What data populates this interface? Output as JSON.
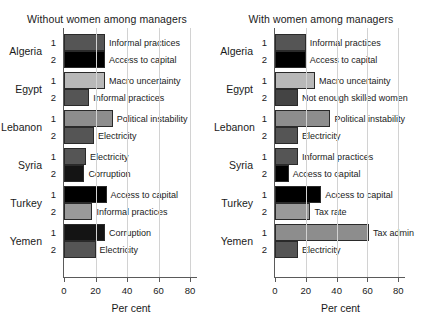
{
  "chart_data": {
    "type": "bar",
    "orientation": "horizontal",
    "title": "",
    "xlabel": "Per cent",
    "ylabel": "",
    "xlim": [
      0,
      85
    ],
    "xticks": [
      0,
      20,
      40,
      60,
      80
    ],
    "grid": true,
    "legend": "none",
    "panels": [
      {
        "title": "Without women among managers",
        "xlabel": "Per cent",
        "groups": [
          {
            "country": "Algeria",
            "items": [
              {
                "rank": "1",
                "label": "Informal practices",
                "value": 26,
                "color": "#555555"
              },
              {
                "rank": "2",
                "label": "Access to capital",
                "value": 26,
                "color": "#000000"
              }
            ]
          },
          {
            "country": "Egypt",
            "items": [
              {
                "rank": "1",
                "label": "Macro uncertainty",
                "value": 26,
                "color": "#b8b8b8"
              },
              {
                "rank": "2",
                "label": "Informal practices",
                "value": 16,
                "color": "#555555"
              }
            ]
          },
          {
            "country": "Lebanon",
            "items": [
              {
                "rank": "1",
                "label": "Political instability",
                "value": 31,
                "color": "#8d8d8d"
              },
              {
                "rank": "2",
                "label": "Electricity",
                "value": 19,
                "color": "#555555"
              }
            ]
          },
          {
            "country": "Syria",
            "items": [
              {
                "rank": "1",
                "label": "Electricity",
                "value": 14,
                "color": "#555555"
              },
              {
                "rank": "2",
                "label": "Corruption",
                "value": 13,
                "color": "#141414"
              }
            ]
          },
          {
            "country": "Turkey",
            "items": [
              {
                "rank": "1",
                "label": "Access to capital",
                "value": 27,
                "color": "#000000"
              },
              {
                "rank": "2",
                "label": "Informal practices",
                "value": 18,
                "color": "#9a9a9a"
              }
            ]
          },
          {
            "country": "Yemen",
            "items": [
              {
                "rank": "1",
                "label": "Corruption",
                "value": 26,
                "color": "#141414"
              },
              {
                "rank": "2",
                "label": "Electricity",
                "value": 20,
                "color": "#555555"
              }
            ]
          }
        ]
      },
      {
        "title": "With women among managers",
        "xlabel": "Per cent",
        "groups": [
          {
            "country": "Algeria",
            "items": [
              {
                "rank": "1",
                "label": "Informal practices",
                "value": 20,
                "color": "#555555"
              },
              {
                "rank": "2",
                "label": "Access to capital",
                "value": 20,
                "color": "#000000"
              }
            ]
          },
          {
            "country": "Egypt",
            "items": [
              {
                "rank": "1",
                "label": "Macro uncertainty",
                "value": 26,
                "color": "#b8b8b8"
              },
              {
                "rank": "2",
                "label": "Not enough skilled women",
                "value": 15,
                "color": "#444444"
              }
            ]
          },
          {
            "country": "Lebanon",
            "items": [
              {
                "rank": "1",
                "label": "Political instability",
                "value": 36,
                "color": "#8d8d8d"
              },
              {
                "rank": "2",
                "label": "Electricity",
                "value": 15,
                "color": "#555555"
              }
            ]
          },
          {
            "country": "Syria",
            "items": [
              {
                "rank": "1",
                "label": "Informal practices",
                "value": 15,
                "color": "#555555"
              },
              {
                "rank": "2",
                "label": "Access to capital",
                "value": 9,
                "color": "#000000"
              }
            ]
          },
          {
            "country": "Turkey",
            "items": [
              {
                "rank": "1",
                "label": "Access to capital",
                "value": 30,
                "color": "#000000"
              },
              {
                "rank": "2",
                "label": "Tax rate",
                "value": 23,
                "color": "#9a9a9a"
              }
            ]
          },
          {
            "country": "Yemen",
            "items": [
              {
                "rank": "1",
                "label": "Tax admin",
                "value": 61,
                "color": "#8d8d8d"
              },
              {
                "rank": "2",
                "label": "Electricity",
                "value": 15,
                "color": "#555555"
              }
            ]
          }
        ]
      }
    ]
  }
}
